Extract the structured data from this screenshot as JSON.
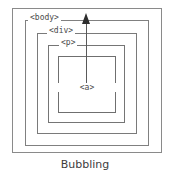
{
  "diagram": {
    "title": "Bubbling",
    "caption": "Bubbling",
    "type": "event-propagation-nesting",
    "background_color": "#ffffff",
    "border_color": "#7d7d7d",
    "text_color": "#4a4a4a",
    "arrow_color": "#2e2e2e",
    "arrow": {
      "name": "bubbling-arrow",
      "direction": "up",
      "from": "<a>",
      "to": "<body>",
      "description": "event bubbles upward from innermost element to outermost"
    },
    "boxes": [
      {
        "id": "outer",
        "label": "",
        "level": 0
      },
      {
        "id": "body",
        "label": "<body>",
        "level": 1
      },
      {
        "id": "div",
        "label": "<div>",
        "level": 2
      },
      {
        "id": "p",
        "label": "<p>",
        "level": 3
      },
      {
        "id": "a",
        "label": "<a>",
        "level": 4
      }
    ]
  }
}
